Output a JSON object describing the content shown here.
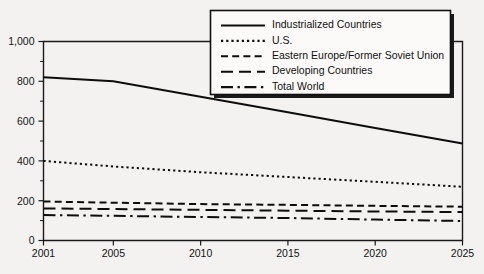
{
  "chart_data": {
    "type": "line",
    "title": "",
    "subtitle": "",
    "xlabel": "",
    "ylabel": "",
    "xlim": [
      2001,
      2025
    ],
    "ylim": [
      0,
      1000
    ],
    "grid": false,
    "legend_position": "top-right",
    "x": [
      2001,
      2005,
      2010,
      2015,
      2020,
      2025
    ],
    "x_tick_labels": [
      "2001",
      "2005",
      "2010",
      "2015",
      "2020",
      "2025"
    ],
    "y_tick_values": [
      0,
      200,
      400,
      600,
      800,
      1000
    ],
    "y_tick_labels": [
      "0",
      "200",
      "400",
      "600",
      "800",
      "1,000"
    ],
    "y_minor_tick_values": [
      100,
      300,
      500,
      700,
      900
    ],
    "series": [
      {
        "name": "Industrialized Countries",
        "dash": "solid",
        "values": [
          820,
          800,
          722,
          645,
          565,
          487
        ]
      },
      {
        "name": "U.S.",
        "dash": "dotted",
        "values": [
          400,
          372,
          343,
          319,
          295,
          270
        ]
      },
      {
        "name": "Eastern Europe/Former Soviet Union",
        "dash": "dashed",
        "values": [
          196,
          190,
          183,
          179,
          174,
          170
        ]
      },
      {
        "name": "Developing Countries",
        "dash": "long-dash",
        "values": [
          161,
          158,
          154,
          150,
          146,
          143
        ]
      },
      {
        "name": "Total World",
        "dash": "dash-dot",
        "values": [
          128,
          124,
          118,
          113,
          105,
          98
        ]
      }
    ]
  },
  "legend": {
    "items": [
      {
        "label": "Industrialized Countries",
        "swatch": "solid-line-swatch"
      },
      {
        "label": "U.S.",
        "swatch": "dotted-line-swatch"
      },
      {
        "label": "Eastern Europe/Former Soviet Union",
        "swatch": "dashed-line-swatch"
      },
      {
        "label": "Developing Countries",
        "swatch": "long-dash-line-swatch"
      },
      {
        "label": "Total World",
        "swatch": "dash-dot-line-swatch"
      }
    ]
  },
  "axes": {
    "y_labels": [
      "1,000",
      "800",
      "600",
      "400",
      "200",
      "0"
    ],
    "x_labels": [
      "2001",
      "2005",
      "2010",
      "2015",
      "2020",
      "2025"
    ]
  },
  "colors": {
    "ink": "#0d0d0d",
    "paper": "#f3f2f0",
    "legend_fill": "#fbfaf8"
  }
}
